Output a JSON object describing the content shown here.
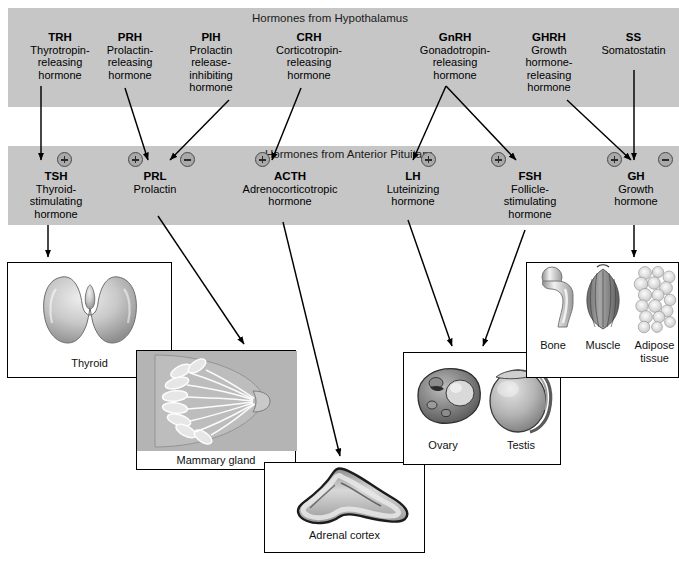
{
  "bands": {
    "hypothalamus_title": "Hormones from Hypothalamus",
    "pituitary_title": "Hormones from Anterior Pituitary"
  },
  "hypothalamic_hormones": [
    {
      "abbr": "TRH",
      "full": "Thyrotropin-\nreleasing\nhormone"
    },
    {
      "abbr": "PRH",
      "full": "Prolactin-\nreleasing\nhormone"
    },
    {
      "abbr": "PIH",
      "full": "Prolactin\nrelease-\ninhibiting\nhormone"
    },
    {
      "abbr": "CRH",
      "full": "Corticotropin-\nreleasing\nhormone"
    },
    {
      "abbr": "GnRH",
      "full": "Gonadotropin-\nreleasing\nhormone"
    },
    {
      "abbr": "GHRH",
      "full": "Growth\nhormone-\nreleasing\nhormone"
    },
    {
      "abbr": "SS",
      "full": "Somatostatin"
    }
  ],
  "pituitary_hormones": [
    {
      "abbr": "TSH",
      "full": "Thyroid-\nstimulating\nhormone"
    },
    {
      "abbr": "PRL",
      "full": "Prolactin"
    },
    {
      "abbr": "ACTH",
      "full": "Adrenocorticotropic\nhormone"
    },
    {
      "abbr": "LH",
      "full": "Luteinizing\nhormone"
    },
    {
      "abbr": "FSH",
      "full": "Follicle-\nstimulating\nhormone"
    },
    {
      "abbr": "GH",
      "full": "Growth\nhormone"
    }
  ],
  "regulation_badges": [
    {
      "target": "TSH",
      "sign": "+"
    },
    {
      "target": "PRL",
      "sign": "+"
    },
    {
      "target": "PRL",
      "sign": "−"
    },
    {
      "target": "ACTH",
      "sign": "+"
    },
    {
      "target": "LH",
      "sign": "+"
    },
    {
      "target": "FSH",
      "sign": "+"
    },
    {
      "target": "GH",
      "sign": "+"
    },
    {
      "target": "GH",
      "sign": "−"
    }
  ],
  "target_panels": [
    {
      "id": "thyroid",
      "caption": "Thyroid"
    },
    {
      "id": "mammary",
      "caption": "Mammary gland"
    },
    {
      "id": "adrenal",
      "caption": "Adrenal cortex"
    },
    {
      "id": "gonad",
      "caption_ovary": "Ovary",
      "caption_testis": "Testis"
    },
    {
      "id": "bma",
      "caption_bone": "Bone",
      "caption_muscle": "Muscle",
      "caption_adipose": "Adipose\ntissue"
    }
  ],
  "colors": {
    "band_gray": "#c6c6c6",
    "badge_gray": "#a9a9a9",
    "line_black": "#000000",
    "page_white": "#ffffff"
  }
}
